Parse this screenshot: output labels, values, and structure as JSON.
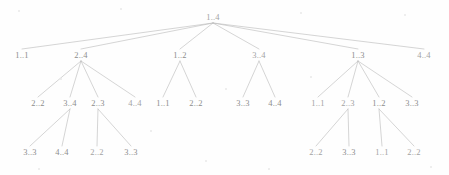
{
  "diagram": {
    "kind": "recursion-call-tree",
    "notation": "range a..b",
    "background_color": "#fefefe",
    "edge_color": "#b9b9b9",
    "label_color": "#8d8d8d",
    "width": 449,
    "height": 175
  },
  "chart_data": {
    "type": "diagram",
    "title": "",
    "nodes": [
      {
        "id": "n0",
        "label": "1..4",
        "x": 213,
        "y": 17,
        "level": 0,
        "tone": "faint"
      },
      {
        "id": "n1",
        "label": "1..1",
        "x": 22,
        "y": 55,
        "level": 1,
        "tone": "normal"
      },
      {
        "id": "n2",
        "label": "2..4",
        "x": 81,
        "y": 55,
        "level": 1,
        "tone": "normal"
      },
      {
        "id": "n3",
        "label": "1..2",
        "x": 180,
        "y": 55,
        "level": 1,
        "tone": "normal"
      },
      {
        "id": "n4",
        "label": "3..4",
        "x": 259,
        "y": 55,
        "level": 1,
        "tone": "faint"
      },
      {
        "id": "n5",
        "label": "1..3",
        "x": 358,
        "y": 55,
        "level": 1,
        "tone": "normal"
      },
      {
        "id": "n6",
        "label": "4..4",
        "x": 424,
        "y": 55,
        "level": 1,
        "tone": "faint"
      },
      {
        "id": "n2a",
        "label": "2..2",
        "x": 38,
        "y": 103,
        "level": 2,
        "tone": "normal"
      },
      {
        "id": "n2b",
        "label": "3..4",
        "x": 70,
        "y": 103,
        "level": 2,
        "tone": "normal"
      },
      {
        "id": "n2c",
        "label": "2..3",
        "x": 98,
        "y": 103,
        "level": 2,
        "tone": "normal"
      },
      {
        "id": "n2d",
        "label": "4..4",
        "x": 135,
        "y": 103,
        "level": 2,
        "tone": "faint"
      },
      {
        "id": "n3a",
        "label": "1..1",
        "x": 163,
        "y": 103,
        "level": 2,
        "tone": "normal"
      },
      {
        "id": "n3b",
        "label": "2..2",
        "x": 196,
        "y": 103,
        "level": 2,
        "tone": "normal"
      },
      {
        "id": "n4a",
        "label": "3..3",
        "x": 243,
        "y": 103,
        "level": 2,
        "tone": "normal"
      },
      {
        "id": "n4b",
        "label": "4..4",
        "x": 275,
        "y": 103,
        "level": 2,
        "tone": "normal"
      },
      {
        "id": "n5a",
        "label": "1..1",
        "x": 318,
        "y": 103,
        "level": 2,
        "tone": "faint"
      },
      {
        "id": "n5b",
        "label": "2..3",
        "x": 348,
        "y": 103,
        "level": 2,
        "tone": "faint"
      },
      {
        "id": "n5c",
        "label": "1..2",
        "x": 379,
        "y": 103,
        "level": 2,
        "tone": "normal"
      },
      {
        "id": "n5d",
        "label": "3..3",
        "x": 412,
        "y": 103,
        "level": 2,
        "tone": "normal"
      },
      {
        "id": "n2b1",
        "label": "3..3",
        "x": 30,
        "y": 152,
        "level": 3,
        "tone": "normal"
      },
      {
        "id": "n2b2",
        "label": "4..4",
        "x": 62,
        "y": 152,
        "level": 3,
        "tone": "normal"
      },
      {
        "id": "n2c1",
        "label": "2..2",
        "x": 97,
        "y": 152,
        "level": 3,
        "tone": "faint"
      },
      {
        "id": "n2c2",
        "label": "3..3",
        "x": 131,
        "y": 152,
        "level": 3,
        "tone": "normal"
      },
      {
        "id": "n5b1",
        "label": "2..2",
        "x": 316,
        "y": 152,
        "level": 3,
        "tone": "faint"
      },
      {
        "id": "n5b2",
        "label": "3..3",
        "x": 349,
        "y": 152,
        "level": 3,
        "tone": "normal"
      },
      {
        "id": "n5c1",
        "label": "1..1",
        "x": 382,
        "y": 152,
        "level": 3,
        "tone": "faint"
      },
      {
        "id": "n5c2",
        "label": "2..2",
        "x": 414,
        "y": 152,
        "level": 3,
        "tone": "faint"
      }
    ],
    "edges": [
      {
        "from": "n0",
        "to": "n1"
      },
      {
        "from": "n0",
        "to": "n2"
      },
      {
        "from": "n0",
        "to": "n3"
      },
      {
        "from": "n0",
        "to": "n4"
      },
      {
        "from": "n0",
        "to": "n5"
      },
      {
        "from": "n0",
        "to": "n6"
      },
      {
        "from": "n2",
        "to": "n2a"
      },
      {
        "from": "n2",
        "to": "n2b"
      },
      {
        "from": "n2",
        "to": "n2c"
      },
      {
        "from": "n2",
        "to": "n2d"
      },
      {
        "from": "n3",
        "to": "n3a"
      },
      {
        "from": "n3",
        "to": "n3b"
      },
      {
        "from": "n4",
        "to": "n4a"
      },
      {
        "from": "n4",
        "to": "n4b"
      },
      {
        "from": "n5",
        "to": "n5a"
      },
      {
        "from": "n5",
        "to": "n5b"
      },
      {
        "from": "n5",
        "to": "n5c"
      },
      {
        "from": "n5",
        "to": "n5d"
      },
      {
        "from": "n2b",
        "to": "n2b1"
      },
      {
        "from": "n2b",
        "to": "n2b2"
      },
      {
        "from": "n2c",
        "to": "n2c1"
      },
      {
        "from": "n2c",
        "to": "n2c2"
      },
      {
        "from": "n5b",
        "to": "n5b1"
      },
      {
        "from": "n5b",
        "to": "n5b2"
      },
      {
        "from": "n5c",
        "to": "n5c1"
      },
      {
        "from": "n5c",
        "to": "n5c2"
      }
    ]
  },
  "specks": [
    {
      "x": 18,
      "y": 10,
      "r": 1.2
    },
    {
      "x": 120,
      "y": 8,
      "r": 1.0
    },
    {
      "x": 300,
      "y": 12,
      "r": 1.1
    },
    {
      "x": 404,
      "y": 14,
      "r": 1.0
    },
    {
      "x": 60,
      "y": 78,
      "r": 0.9
    },
    {
      "x": 225,
      "y": 88,
      "r": 1.0
    },
    {
      "x": 310,
      "y": 76,
      "r": 0.9
    },
    {
      "x": 150,
      "y": 130,
      "r": 1.1
    },
    {
      "x": 205,
      "y": 160,
      "r": 1.0
    },
    {
      "x": 38,
      "y": 168,
      "r": 1.2
    },
    {
      "x": 430,
      "y": 166,
      "r": 1.0
    },
    {
      "x": 268,
      "y": 168,
      "r": 0.9
    }
  ]
}
